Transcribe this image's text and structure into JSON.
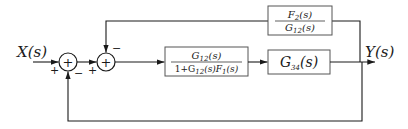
{
  "diagram": {
    "type": "block-diagram",
    "input": {
      "label": "X(s)"
    },
    "output": {
      "label": "Y(s)"
    },
    "summing_junctions": [
      {
        "id": "sum1",
        "symbol": "+",
        "signs": {
          "left": "+",
          "bottom": "−"
        }
      },
      {
        "id": "sum2",
        "symbol": "+",
        "signs": {
          "left": "+",
          "top": "−"
        }
      }
    ],
    "blocks": [
      {
        "id": "forward-block",
        "numerator": {
          "base": "G",
          "sub": "12",
          "arg": "(s)"
        },
        "denominator_text": "1+G12(s)F1(s)",
        "denominator": [
          {
            "t": "1+G"
          },
          {
            "sub": "12"
          },
          {
            "t": "(s)F"
          },
          {
            "sub": "1"
          },
          {
            "t": "(s)"
          }
        ]
      },
      {
        "id": "g34-block",
        "label": {
          "base": "G",
          "sub": "34",
          "arg": "(s)"
        }
      },
      {
        "id": "feedback-block",
        "numerator": {
          "base": "F",
          "sub": "2",
          "arg": "(s)"
        },
        "denominator": {
          "base": "G",
          "sub": "12",
          "arg": "(s)"
        }
      }
    ],
    "connections": [
      "X(s) -> sum1 (+)",
      "sum1 -> sum2 (+)",
      "sum2 -> forward-block",
      "forward-block -> g34-block",
      "g34-block -> Y(s)",
      "Y(s) -> feedback-block -> sum2 (−)",
      "Y(s) -> sum1 (−)"
    ]
  }
}
